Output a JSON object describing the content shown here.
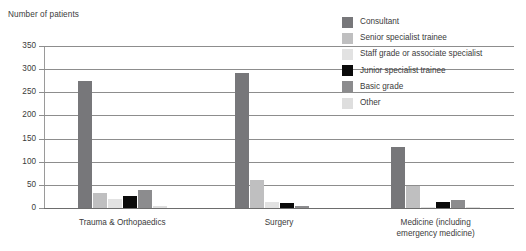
{
  "chart_data": {
    "type": "bar",
    "title": "",
    "subtitle": "",
    "xlabel": "",
    "ylabel": "Number of patients",
    "ylim": [
      0,
      350
    ],
    "ytick_step": 50,
    "ytick_labels": [
      "350",
      "300",
      "250",
      "200",
      "150",
      "100",
      "50",
      "0"
    ],
    "ytick_values": [
      350,
      300,
      250,
      200,
      150,
      100,
      50,
      0
    ],
    "grid": true,
    "legend_position": "top-right",
    "categories": [
      "Trauma & Orthopaedics",
      "Surgery",
      "Medicine (including emergency medicine)"
    ],
    "category_label_lines": [
      [
        "Trauma & Orthopaedics"
      ],
      [
        "Surgery"
      ],
      [
        "Medicine (including",
        "emergency medicine)"
      ]
    ],
    "series": [
      {
        "name": "Consultant",
        "color": "#77777a",
        "values": [
          275,
          292,
          132
        ]
      },
      {
        "name": "Senior specialist trainee",
        "color": "#bfbfc0",
        "values": [
          32,
          60,
          48
        ]
      },
      {
        "name": "Staff grade or associate specialist",
        "color": "#e2e2e2",
        "values": [
          20,
          12,
          2
        ]
      },
      {
        "name": "Junior specialist trainee",
        "color": "#0a0a0a",
        "values": [
          25,
          10,
          14
        ]
      },
      {
        "name": "Basic grade",
        "color": "#8c8c8e",
        "values": [
          38,
          4,
          18
        ]
      },
      {
        "name": "Other",
        "color": "#dedede",
        "values": [
          4,
          0,
          2
        ]
      }
    ]
  },
  "legend": {
    "items": [
      {
        "label": "Consultant",
        "color": "#77777a"
      },
      {
        "label": "Senior specialist trainee",
        "color": "#bfbfc0"
      },
      {
        "label": "Staff grade or associate specialist",
        "color": "#e2e2e2"
      },
      {
        "label": "Junior specialist trainee",
        "color": "#0a0a0a"
      },
      {
        "label": "Basic grade",
        "color": "#8c8c8e"
      },
      {
        "label": "Other",
        "color": "#dedede"
      }
    ]
  },
  "axis": {
    "y_title": "Number of patients"
  },
  "colors": {
    "grid": "#8d8d8d",
    "text": "#3b3b3b",
    "background": "#ffffff"
  }
}
